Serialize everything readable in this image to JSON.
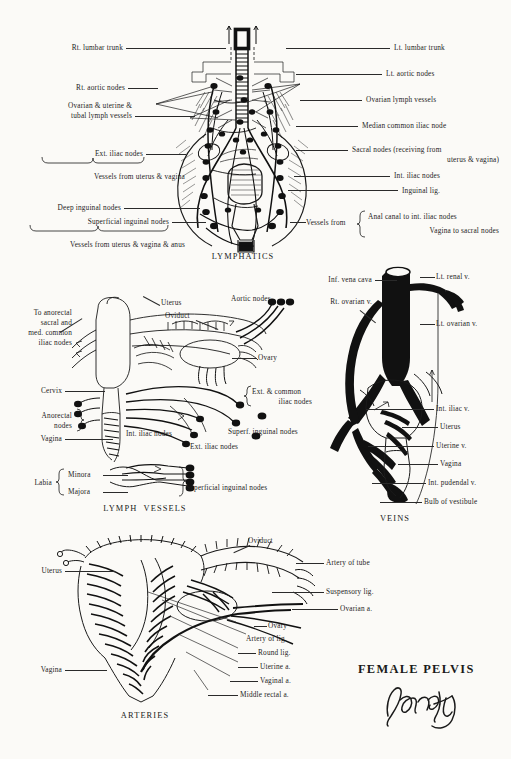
{
  "page": {
    "title": "FEMALE PELVIS",
    "signature": "Pansky",
    "background_color": "#fbfaf7",
    "ink_color": "#1a1a1a"
  },
  "sections": [
    {
      "id": "lymphatics",
      "title": "LYMPHATICS"
    },
    {
      "id": "lymph_vessels",
      "title": "LYMPH  VESSELS"
    },
    {
      "id": "veins",
      "title": "VEINS"
    },
    {
      "id": "arteries",
      "title": "ARTERIES"
    }
  ],
  "lymphatics": {
    "title": "LYMPHATICS",
    "left_labels": [
      {
        "text": "Rt. lumbar trunk",
        "leader": true
      },
      {
        "text": "Rt. aortic nodes",
        "leader": true
      },
      {
        "text": "Ovarian & uterine &",
        "leader": false
      },
      {
        "text": "tubal lymph vessels",
        "leader": true
      },
      {
        "text": "Ext. iliac nodes",
        "leader": true,
        "brace": "below"
      },
      {
        "text": "Vessels from uterus & vagina",
        "leader": false
      },
      {
        "text": "Deep inguinal nodes",
        "leader": true
      },
      {
        "text": "Superficial inguinal nodes",
        "leader": true,
        "brace": "below"
      },
      {
        "text": "Vessels from uterus & vagina & anus",
        "leader": false
      }
    ],
    "right_labels": [
      {
        "text": "Lt. lumbar trunk",
        "leader": true
      },
      {
        "text": "Lt. aortic nodes",
        "leader": true
      },
      {
        "text": "Ovarian lymph vessels",
        "leader": true
      },
      {
        "text": "Median common iliac node",
        "leader": true
      },
      {
        "text": "Sacral nodes (receiving from",
        "leader": true
      },
      {
        "text": "uterus & vagina)",
        "leader": false
      },
      {
        "text": "Int. iliac nodes",
        "leader": true
      },
      {
        "text": "Inguinal lig.",
        "leader": true
      },
      {
        "text": "Vessels from",
        "leader": false,
        "brace": "right"
      },
      {
        "text": "Anal canal to int. iliac nodes",
        "leader": false
      },
      {
        "text": "Vagina to sacral nodes",
        "leader": false
      }
    ]
  },
  "lymph_vessels": {
    "title": "LYMPH  VESSELS",
    "labels": [
      {
        "text": "Uterus"
      },
      {
        "text": "Oviduct"
      },
      {
        "text": "Aortic nodes"
      },
      {
        "text": "To anorectal"
      },
      {
        "text": "sacral and"
      },
      {
        "text": "med. common"
      },
      {
        "text": "iliac nodes"
      },
      {
        "text": "Ovary"
      },
      {
        "text": "Cervix"
      },
      {
        "text": "Ext. & common"
      },
      {
        "text": "iliac nodes"
      },
      {
        "text": "Anorectal"
      },
      {
        "text": "nodes"
      },
      {
        "text": "Int. iliac nodes"
      },
      {
        "text": "Superf. inguinal nodes"
      },
      {
        "text": "Ext. iliac nodes"
      },
      {
        "text": "Vagina"
      },
      {
        "text": "Labia"
      },
      {
        "text": "Minora"
      },
      {
        "text": "Majora"
      },
      {
        "text": "Superficial inguinal nodes"
      }
    ]
  },
  "veins": {
    "title": "VEINS",
    "labels": [
      {
        "text": "Inf. vena cava"
      },
      {
        "text": "Rt. ovarian v."
      },
      {
        "text": "Lt. renal v."
      },
      {
        "text": "Lt. ovarian v."
      },
      {
        "text": "Int. iliac v."
      },
      {
        "text": "Uterus"
      },
      {
        "text": "Uterine v."
      },
      {
        "text": "Vagina"
      },
      {
        "text": "Int. pudendal v."
      },
      {
        "text": "Bulb of vestibule"
      }
    ]
  },
  "arteries": {
    "title": "ARTERIES",
    "labels": [
      {
        "text": "Oviduct"
      },
      {
        "text": "Uterus"
      },
      {
        "text": "Artery of tube"
      },
      {
        "text": "Suspensory lig."
      },
      {
        "text": "Ovarian a."
      },
      {
        "text": "Ovary"
      },
      {
        "text": "Artery of lig."
      },
      {
        "text": "Round lig."
      },
      {
        "text": "Uterine a."
      },
      {
        "text": "Vaginal a."
      },
      {
        "text": "Middle rectal a."
      },
      {
        "text": "Vagina"
      }
    ]
  }
}
